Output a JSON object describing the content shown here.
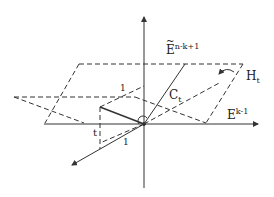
{
  "diagram": {
    "labels": {
      "E_tilde_base": "E",
      "E_tilde_tilde": "~",
      "E_tilde_sup": "n-k+1",
      "H": "H",
      "H_sub": "t",
      "C": "C",
      "C_sub": "t",
      "E_base": "E",
      "E_sup": "k-1",
      "t_label": "t",
      "one_label_upper": "1",
      "one_label_lower": "1"
    },
    "colors": {
      "stroke": "#333333",
      "background": "#ffffff"
    }
  }
}
